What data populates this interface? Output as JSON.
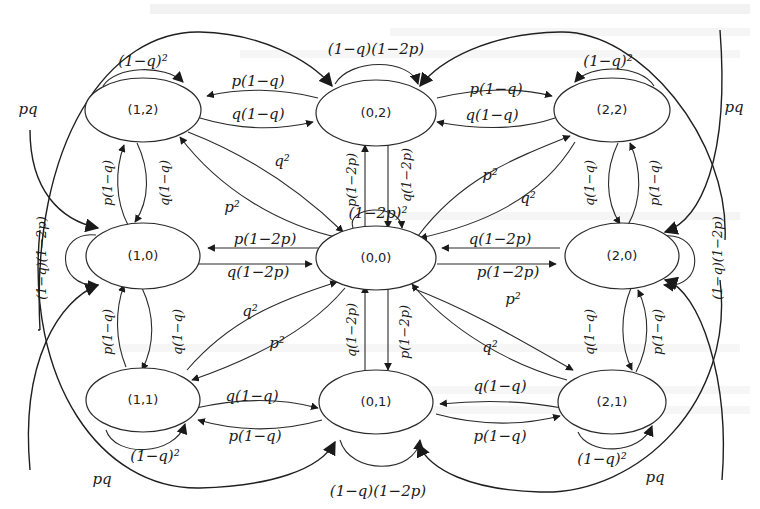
{
  "diagram": {
    "type": "state-transition-diagram",
    "nodes": [
      {
        "id": "n12",
        "label": "(1,2)"
      },
      {
        "id": "n02",
        "label": "(0,2)"
      },
      {
        "id": "n22",
        "label": "(2,2)"
      },
      {
        "id": "n10",
        "label": "(1,0)"
      },
      {
        "id": "n00",
        "label": "(0,0)"
      },
      {
        "id": "n20",
        "label": "(2,0)"
      },
      {
        "id": "n11",
        "label": "(1,1)"
      },
      {
        "id": "n01",
        "label": "(0,1)"
      },
      {
        "id": "n21",
        "label": "(2,1)"
      }
    ],
    "edge_labels": {
      "loop_12": "(1−q)²",
      "loop_02": "(1−q)(1−2p)",
      "loop_22": "(1−q)²",
      "loop_10": "(1−q)(1−2p)",
      "loop_00": "(1−2p)²",
      "loop_20": "(1−q)(1−2p)",
      "loop_11": "(1−q)²",
      "loop_01": "(1−q)(1−2p)",
      "loop_21": "(1−q)²",
      "e02_12": "p(1−q)",
      "e12_02": "q(1−q)",
      "e02_22": "p(1−q)",
      "e22_02": "q(1−q)",
      "e12_10": "p(1−q)",
      "e10_12": "q(1−q)",
      "e22_20": "q(1−q)",
      "e20_22": "p(1−q)",
      "e00_12_q2": "q²",
      "e00_12_p2": "p²",
      "e00_22_p2": "p²",
      "e00_22_q2": "q²",
      "e00_02": "p(1−2p)",
      "e02_00": "q(1−2p)",
      "e00_10": "p(1−2p)",
      "e10_00": "q(1−2p)",
      "e20_00": "q(1−2p)",
      "e00_20": "p(1−2p)",
      "e00_11_q2": "q²",
      "e00_11_p2": "p²",
      "e00_21_p2": "p²",
      "e00_21_q2": "q²",
      "e01_00": "q(1−2p)",
      "e00_01": "p(1−2p)",
      "e10_11": "p(1−q)",
      "e11_10": "q(1−q)",
      "e21_20": "q(1−q)",
      "e20_21": "p(1−q)",
      "e11_01": "q(1−q)",
      "e01_11": "p(1−q)",
      "e21_01": "q(1−q)",
      "e01_21": "p(1−q)",
      "pq_top_left": "pq",
      "pq_top_right": "pq",
      "pq_bottom_left": "pq",
      "pq_bottom_right": "pq"
    }
  }
}
